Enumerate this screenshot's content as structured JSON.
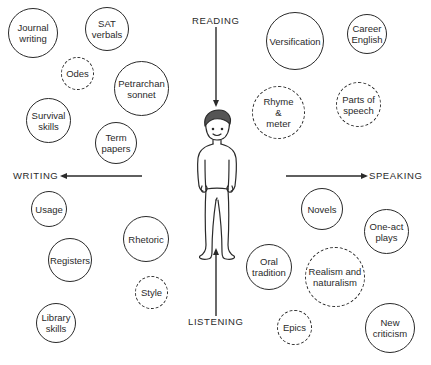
{
  "diagram": {
    "type": "concept-map",
    "center": "student-figure",
    "skills": {
      "reading": "READING",
      "writing": "WRITING",
      "speaking": "SPEAKING",
      "listening": "LISTENING"
    },
    "topics": [
      {
        "label": "Journal\nwriting",
        "quadrant": "top-left"
      },
      {
        "label": "SAT\nverbals",
        "quadrant": "top-left"
      },
      {
        "label": "Odes",
        "quadrant": "top-left"
      },
      {
        "label": "Petrarchan\nsonnet",
        "quadrant": "top-left"
      },
      {
        "label": "Survival\nskills",
        "quadrant": "top-left"
      },
      {
        "label": "Term\npapers",
        "quadrant": "top-left"
      },
      {
        "label": "Versification",
        "quadrant": "top-right"
      },
      {
        "label": "Career\nEnglish",
        "quadrant": "top-right"
      },
      {
        "label": "Rhyme\n&\nmeter",
        "quadrant": "top-right"
      },
      {
        "label": "Parts of\nspeech",
        "quadrant": "top-right"
      },
      {
        "label": "Usage",
        "quadrant": "bottom-left"
      },
      {
        "label": "Registers",
        "quadrant": "bottom-left"
      },
      {
        "label": "Rhetoric",
        "quadrant": "bottom-left"
      },
      {
        "label": "Style",
        "quadrant": "bottom-left"
      },
      {
        "label": "Library\nskills",
        "quadrant": "bottom-left"
      },
      {
        "label": "Novels",
        "quadrant": "bottom-right"
      },
      {
        "label": "One-act\nplays",
        "quadrant": "bottom-right"
      },
      {
        "label": "Oral\ntradition",
        "quadrant": "bottom-right"
      },
      {
        "label": "Realism and\nnaturalism",
        "quadrant": "bottom-right"
      },
      {
        "label": "Epics",
        "quadrant": "bottom-right"
      },
      {
        "label": "New\ncriticism",
        "quadrant": "bottom-right"
      }
    ]
  }
}
